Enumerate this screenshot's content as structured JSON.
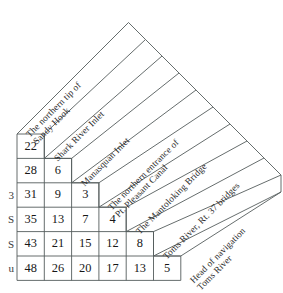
{
  "figure": {
    "kind": "triangular-distance-matrix",
    "orientation": "diagonal-45",
    "ink_color": "#555c5c",
    "text_color": "#1a1a1a",
    "background": "#ffffff"
  },
  "labels": [
    {
      "id": "sandy-hook",
      "lines": [
        "The northern tip of",
        "Sandy Hook"
      ]
    },
    {
      "id": "shark-river-inlet",
      "lines": [
        "Shark River Inlet"
      ]
    },
    {
      "id": "manasquan-inlet",
      "lines": [
        "Manasquan Inlet"
      ]
    },
    {
      "id": "pt-pleasant-canal",
      "lines": [
        "The northern entrance of",
        "Pt. Pleasant Canal"
      ]
    },
    {
      "id": "mantoloking-bridge",
      "lines": [
        "The Mantoloking Bridge"
      ]
    },
    {
      "id": "toms-river-rt37",
      "lines": [
        "Toms River, Rt. 37 bridges"
      ]
    },
    {
      "id": "head-of-navigation",
      "lines": [
        "Head of navigation",
        "Toms River"
      ]
    }
  ],
  "margin_glyphs": [
    "",
    "",
    "3",
    "S",
    "S",
    "u"
  ],
  "chart_data": {
    "type": "table",
    "title": "",
    "xlabel": "",
    "ylabel": "",
    "subtype": "lower-triangular distance matrix (statute miles)",
    "categories": [
      "The northern tip of Sandy Hook",
      "Shark River Inlet",
      "Manasquan Inlet",
      "The northern entrance of Pt. Pleasant Canal",
      "The Mantoloking Bridge",
      "Toms River, Rt. 37 bridges",
      "Head of navigation Toms River"
    ],
    "rows": [
      {
        "row_label": "Shark River Inlet",
        "values": [
          22
        ]
      },
      {
        "row_label": "Manasquan Inlet",
        "values": [
          28,
          6
        ]
      },
      {
        "row_label": "The northern entrance of Pt. Pleasant Canal",
        "values": [
          31,
          9,
          3
        ]
      },
      {
        "row_label": "The Mantoloking Bridge",
        "values": [
          35,
          13,
          7,
          4
        ]
      },
      {
        "row_label": "Toms River, Rt. 37 bridges",
        "values": [
          43,
          21,
          15,
          12,
          8
        ]
      },
      {
        "row_label": "Head of navigation Toms River",
        "values": [
          48,
          26,
          20,
          17,
          13,
          5
        ]
      }
    ],
    "grid": true,
    "legend": "none"
  }
}
